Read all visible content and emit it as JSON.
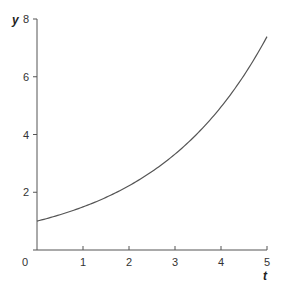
{
  "chart_data": {
    "type": "line",
    "title": "",
    "xlabel": "t",
    "ylabel": "y",
    "xlim": [
      0,
      5
    ],
    "ylim": [
      0,
      8
    ],
    "x_ticks": [
      0,
      1,
      2,
      3,
      4,
      5
    ],
    "x_tick_labels": [
      "0",
      "1",
      "2",
      "3",
      "4",
      "5"
    ],
    "y_ticks": [
      2,
      4,
      6,
      8
    ],
    "y_tick_labels": [
      "2",
      "4",
      "6",
      "8"
    ],
    "grid": false,
    "legend": null,
    "series": [
      {
        "name": "y = e^(0.4t)",
        "x": [
          0,
          0.5,
          1,
          1.5,
          2,
          2.5,
          3,
          3.5,
          4,
          4.5,
          5
        ],
        "values": [
          1.0,
          1.22,
          1.49,
          1.82,
          2.23,
          2.72,
          3.32,
          4.06,
          4.95,
          6.05,
          7.39
        ],
        "color": "#555555"
      }
    ]
  },
  "colors": {
    "axis": "#555555",
    "curve": "#555555",
    "text": "#333333"
  }
}
